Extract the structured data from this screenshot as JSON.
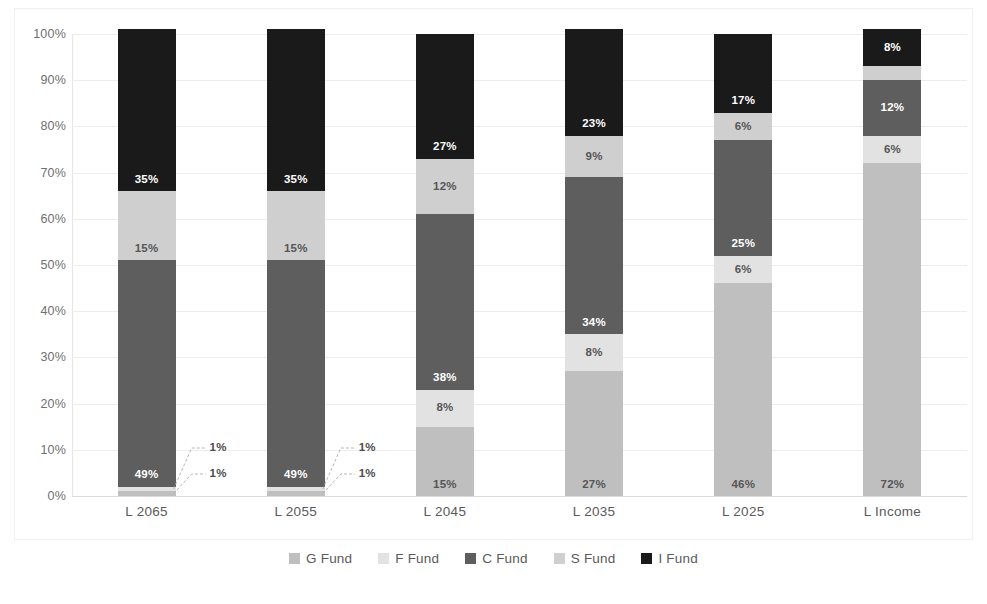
{
  "chart_data": {
    "type": "bar",
    "stacked": true,
    "stack_mode": "percent",
    "title": "",
    "xlabel": "",
    "ylabel": "",
    "ylim": [
      0,
      100
    ],
    "yticks": [
      "0%",
      "10%",
      "20%",
      "30%",
      "40%",
      "50%",
      "60%",
      "70%",
      "80%",
      "90%",
      "100%"
    ],
    "ytick_values": [
      0,
      10,
      20,
      30,
      40,
      50,
      60,
      70,
      80,
      90,
      100
    ],
    "grid": true,
    "legend_position": "bottom",
    "categories": [
      "L 2065",
      "L 2055",
      "L 2045",
      "L 2035",
      "L 2025",
      "L Income"
    ],
    "series": [
      {
        "name": "G Fund",
        "color": "#bfbfbf",
        "label_color": "light",
        "values": [
          1,
          1,
          15,
          27,
          46,
          72
        ],
        "labels": [
          "1%",
          "1%",
          "15%",
          "27%",
          "46%",
          "72%"
        ]
      },
      {
        "name": "F Fund",
        "color": "#e2e2e2",
        "label_color": "light",
        "values": [
          1,
          1,
          8,
          8,
          6,
          6
        ],
        "labels": [
          "1%",
          "1%",
          "8%",
          "8%",
          "6%",
          "6%"
        ]
      },
      {
        "name": "C Fund",
        "color": "#5e5e5e",
        "label_color": "dark",
        "values": [
          49,
          49,
          38,
          34,
          25,
          12
        ],
        "labels": [
          "49%",
          "49%",
          "38%",
          "34%",
          "25%",
          "12%"
        ]
      },
      {
        "name": "S Fund",
        "color": "#cfcfcf",
        "label_color": "light",
        "values": [
          15,
          15,
          12,
          9,
          6,
          3
        ],
        "labels": [
          "15%",
          "15%",
          "12%",
          "9%",
          "6%",
          "3%"
        ]
      },
      {
        "name": "I Fund",
        "color": "#1a1a1a",
        "label_color": "dark",
        "values": [
          35,
          35,
          27,
          23,
          17,
          8
        ],
        "labels": [
          "35%",
          "35%",
          "27%",
          "23%",
          "17%",
          "8%"
        ]
      }
    ],
    "callouts": [
      {
        "category": "L 2065",
        "series": "F Fund",
        "text": "1%"
      },
      {
        "category": "L 2065",
        "series": "G Fund",
        "text": "1%"
      },
      {
        "category": "L 2055",
        "series": "F Fund",
        "text": "1%"
      },
      {
        "category": "L 2055",
        "series": "G Fund",
        "text": "1%"
      }
    ]
  },
  "legend": {
    "items": [
      {
        "label": "G Fund",
        "color": "#bfbfbf"
      },
      {
        "label": "F Fund",
        "color": "#e2e2e2"
      },
      {
        "label": "C Fund",
        "color": "#5e5e5e"
      },
      {
        "label": "S Fund",
        "color": "#cfcfcf"
      },
      {
        "label": "I Fund",
        "color": "#1a1a1a"
      }
    ]
  }
}
